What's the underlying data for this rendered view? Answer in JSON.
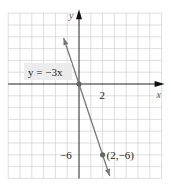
{
  "chart_data": {
    "type": "line",
    "title": "",
    "xlabel": "x",
    "ylabel": "y",
    "xlim": [
      -6,
      7
    ],
    "ylim": [
      -8,
      6
    ],
    "grid": true,
    "grid_step": 1,
    "series": [
      {
        "name": "y = −3x",
        "equation": "y = -3x",
        "slope": -3,
        "intercept": 0,
        "x_range": [
          -1.3,
          2.6
        ],
        "color": "#777777"
      }
    ],
    "points": [
      {
        "x": 0,
        "y": 0,
        "label": ""
      },
      {
        "x": 2,
        "y": -6,
        "label": "(2,−6)"
      }
    ],
    "tick_labels": [
      {
        "axis": "x",
        "value": 2,
        "text": "2"
      },
      {
        "axis": "y",
        "value": -6,
        "text": "−6"
      }
    ],
    "annotations": [
      {
        "text": "y = −3x",
        "near": "line upper-left"
      }
    ]
  }
}
